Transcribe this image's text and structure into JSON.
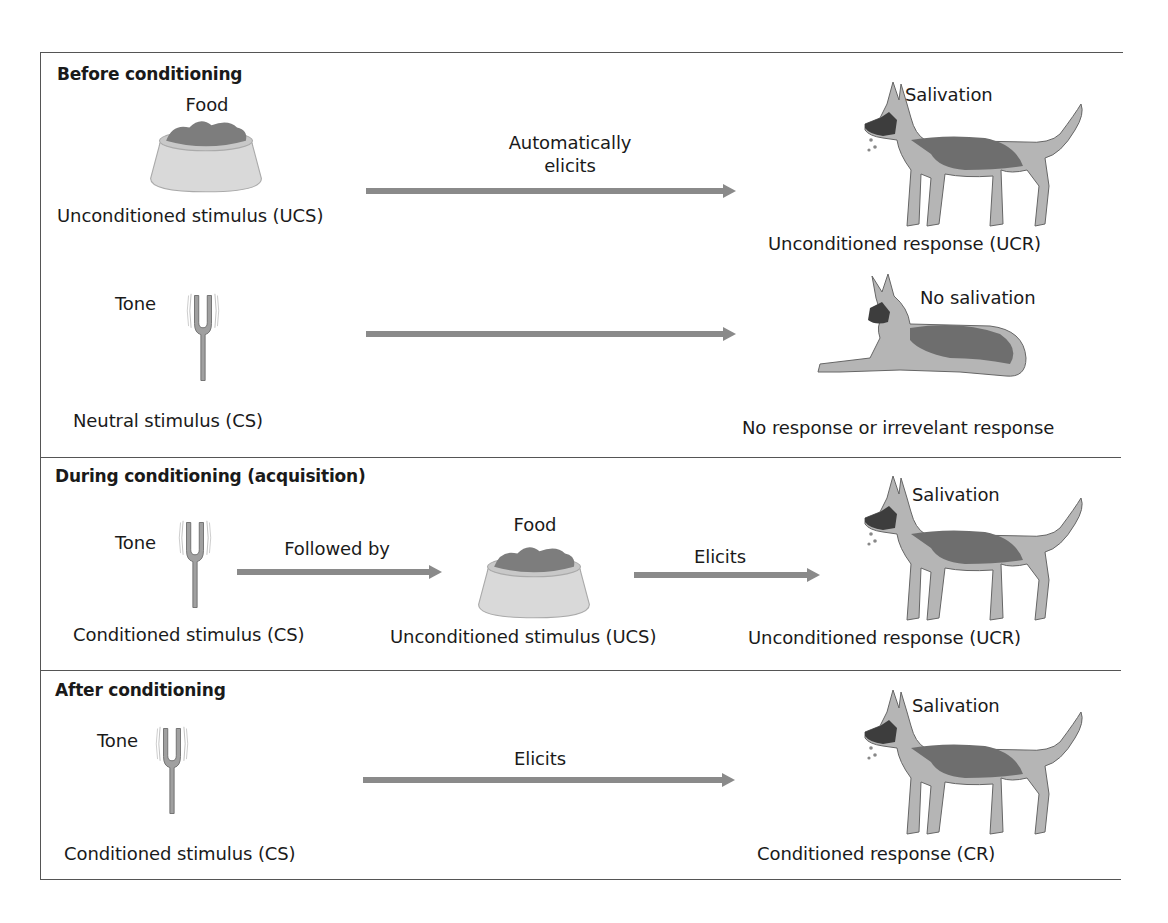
{
  "colors": {
    "border": "#555555",
    "arrow": "#8a8a8a",
    "bowl": "#d8d8d8",
    "food": "#7a7a7a",
    "fork": "#9a9a9a",
    "dog_dark": "#6e6e6e",
    "dog_light": "#b5b5b5",
    "text": "#1a1a1a"
  },
  "sections": [
    {
      "heading": "Before conditioning",
      "rows": [
        {
          "stimulus_top_label": "Food",
          "stimulus_icon": "food-bowl-icon",
          "stimulus_label": "Unconditioned stimulus (UCS)",
          "arrow_label_line1": "Automatically",
          "arrow_label_line2": "elicits",
          "response_icon": "standing-dog-salivating-icon",
          "response_top_label": "Salivation",
          "response_label": "Unconditioned response (UCR)"
        },
        {
          "stimulus_top_label": "Tone",
          "stimulus_icon": "tuning-fork-icon",
          "stimulus_label": "Neutral stimulus (CS)",
          "arrow_label": "",
          "response_icon": "lying-dog-icon",
          "response_top_label": "No salivation",
          "response_label": "No response or irrevelant response"
        }
      ]
    },
    {
      "heading": "During conditioning (acquisition)",
      "stimulus_top_label": "Tone",
      "stimulus_icon": "tuning-fork-icon",
      "stimulus_label": "Conditioned stimulus (CS)",
      "arrow1_label": "Followed by",
      "middle_top_label": "Food",
      "middle_icon": "food-bowl-icon",
      "middle_label": "Unconditioned stimulus (UCS)",
      "arrow2_label": "Elicits",
      "response_icon": "standing-dog-salivating-icon",
      "response_top_label": "Salivation",
      "response_label": "Unconditioned response (UCR)"
    },
    {
      "heading": "After conditioning",
      "stimulus_top_label": "Tone",
      "stimulus_icon": "tuning-fork-icon",
      "stimulus_label": "Conditioned stimulus (CS)",
      "arrow_label": "Elicits",
      "response_icon": "standing-dog-salivating-icon",
      "response_top_label": "Salivation",
      "response_label": "Conditioned response (CR)"
    }
  ]
}
